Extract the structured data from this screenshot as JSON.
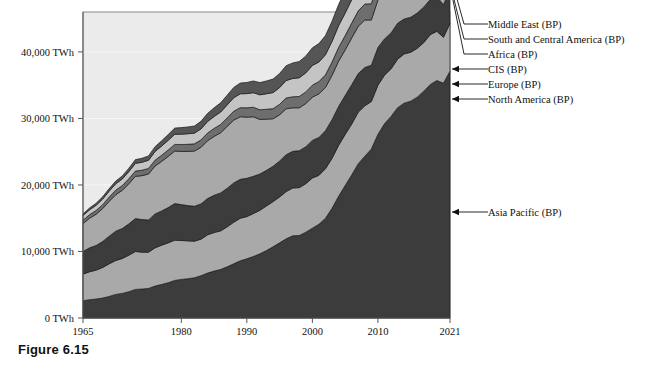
{
  "figure": {
    "caption": "Figure 6.15"
  },
  "chart_data": {
    "type": "area",
    "stacked": true,
    "title": "",
    "xlabel": "",
    "ylabel": "",
    "xlim": [
      1965,
      2021
    ],
    "ylim": [
      0,
      46000
    ],
    "grid": true,
    "legend_position": "right-callouts",
    "x_tick_labels": [
      "1965",
      "1980",
      "1990",
      "2000",
      "2010",
      "2021"
    ],
    "x_ticks": [
      1965,
      1980,
      1990,
      2000,
      2010,
      2021
    ],
    "y_tick_labels": [
      "0 TWh",
      "10,000 TWh",
      "20,000 TWh",
      "30,000 TWh",
      "40,000 TWh"
    ],
    "y_ticks": [
      0,
      10000,
      20000,
      30000,
      40000
    ],
    "unit": "TWh",
    "x": [
      1965,
      1966,
      1967,
      1968,
      1969,
      1970,
      1971,
      1972,
      1973,
      1974,
      1975,
      1976,
      1977,
      1978,
      1979,
      1980,
      1981,
      1982,
      1983,
      1984,
      1985,
      1986,
      1987,
      1988,
      1989,
      1990,
      1991,
      1992,
      1993,
      1994,
      1995,
      1996,
      1997,
      1998,
      1999,
      2000,
      2001,
      2002,
      2003,
      2004,
      2005,
      2006,
      2007,
      2008,
      2009,
      2010,
      2011,
      2012,
      2013,
      2014,
      2015,
      2016,
      2017,
      2018,
      2019,
      2020,
      2021
    ],
    "series": [
      {
        "name": "Asia Pacific (BP)",
        "color": "#3c3c3c",
        "values": [
          2600,
          2750,
          2850,
          3000,
          3250,
          3550,
          3700,
          3950,
          4300,
          4350,
          4450,
          4800,
          5050,
          5300,
          5650,
          5800,
          5900,
          6050,
          6350,
          6750,
          7050,
          7300,
          7700,
          8150,
          8600,
          8900,
          9250,
          9650,
          10150,
          10700,
          11300,
          11900,
          12350,
          12400,
          12900,
          13500,
          14100,
          15000,
          16500,
          18300,
          19900,
          21500,
          23200,
          24300,
          25400,
          27600,
          29200,
          30300,
          31600,
          32300,
          32600,
          33200,
          34100,
          35100,
          35700,
          35300,
          37100
        ]
      },
      {
        "name": "North America (BP)",
        "color": "#a9a9a9",
        "values": [
          4000,
          4200,
          4350,
          4600,
          4900,
          5100,
          5250,
          5500,
          5700,
          5550,
          5450,
          5750,
          5900,
          6000,
          6050,
          5850,
          5700,
          5500,
          5500,
          5750,
          5800,
          5800,
          6000,
          6250,
          6400,
          6350,
          6450,
          6550,
          6700,
          6800,
          6900,
          7100,
          7200,
          7200,
          7300,
          7550,
          7350,
          7450,
          7500,
          7650,
          7700,
          7650,
          7750,
          7600,
          7150,
          7400,
          7300,
          7150,
          7300,
          7400,
          7350,
          7350,
          7300,
          7500,
          7400,
          6900,
          7200
        ]
      },
      {
        "name": "Europe (BP)",
        "color": "#3c3c3c",
        "values": [
          3400,
          3600,
          3700,
          3900,
          4150,
          4400,
          4500,
          4700,
          4950,
          4900,
          4850,
          5100,
          5150,
          5300,
          5500,
          5400,
          5300,
          5250,
          5300,
          5450,
          5600,
          5700,
          5800,
          5900,
          5850,
          5750,
          5600,
          5450,
          5350,
          5300,
          5400,
          5550,
          5500,
          5550,
          5550,
          5650,
          5700,
          5700,
          5800,
          5850,
          5850,
          5900,
          5800,
          5750,
          5450,
          5650,
          5450,
          5400,
          5400,
          5250,
          5250,
          5300,
          5350,
          5300,
          5200,
          4900,
          5150
        ]
      },
      {
        "name": "CIS (BP)",
        "color": "#a9a9a9",
        "values": [
          4200,
          4450,
          4700,
          4950,
          5250,
          5500,
          5750,
          6050,
          6350,
          6600,
          6900,
          7200,
          7450,
          7700,
          7900,
          8000,
          8150,
          8300,
          8500,
          8700,
          8850,
          9050,
          9300,
          9450,
          9400,
          9200,
          8950,
          8200,
          7700,
          7150,
          6950,
          6900,
          6550,
          6450,
          6500,
          6500,
          6550,
          6500,
          6700,
          6800,
          6850,
          7050,
          7100,
          7150,
          6800,
          7150,
          7300,
          7350,
          7250,
          7250,
          7150,
          7200,
          7400,
          7600,
          7600,
          7350,
          7800
        ]
      },
      {
        "name": "Africa (BP)",
        "color": "#6e6e6e",
        "values": [
          500,
          530,
          560,
          590,
          630,
          670,
          700,
          740,
          790,
          810,
          840,
          880,
          920,
          960,
          1000,
          1030,
          1060,
          1080,
          1110,
          1150,
          1200,
          1240,
          1280,
          1330,
          1370,
          1400,
          1430,
          1450,
          1480,
          1520,
          1570,
          1620,
          1660,
          1700,
          1740,
          1800,
          1850,
          1900,
          1980,
          2070,
          2150,
          2230,
          2320,
          2400,
          2440,
          2550,
          2600,
          2680,
          2740,
          2800,
          2830,
          2870,
          2920,
          2980,
          3020,
          2950,
          3080
        ]
      },
      {
        "name": "South and Central America (BP)",
        "color": "#c4c4c4",
        "values": [
          700,
          740,
          790,
          840,
          900,
          960,
          1010,
          1080,
          1160,
          1200,
          1230,
          1310,
          1380,
          1450,
          1520,
          1560,
          1590,
          1610,
          1660,
          1730,
          1790,
          1870,
          1950,
          2030,
          2090,
          2130,
          2190,
          2250,
          2330,
          2420,
          2520,
          2630,
          2740,
          2820,
          2860,
          2960,
          2940,
          3030,
          3110,
          3280,
          3400,
          3530,
          3680,
          3800,
          3760,
          3960,
          4050,
          4150,
          4250,
          4300,
          4220,
          4180,
          4230,
          4320,
          4330,
          4100,
          4350
        ]
      },
      {
        "name": "Middle East (BP)",
        "color": "#555555",
        "values": [
          250,
          270,
          300,
          330,
          370,
          410,
          450,
          500,
          560,
          600,
          650,
          720,
          790,
          860,
          930,
          980,
          1020,
          1070,
          1140,
          1220,
          1300,
          1380,
          1460,
          1540,
          1610,
          1680,
          1760,
          1840,
          1930,
          2020,
          2120,
          2230,
          2340,
          2440,
          2530,
          2650,
          2760,
          2880,
          3020,
          3180,
          3340,
          3510,
          3700,
          3890,
          3990,
          4200,
          4350,
          4520,
          4650,
          4780,
          4870,
          4960,
          5060,
          5180,
          5260,
          5150,
          5400
        ]
      }
    ],
    "callouts": [
      {
        "label": "Middle East (BP)",
        "series": "Middle East (BP)"
      },
      {
        "label": "South and Central America (BP)",
        "series": "South and Central America (BP)"
      },
      {
        "label": "Africa (BP)",
        "series": "Africa (BP)"
      },
      {
        "label": "CIS (BP)",
        "series": "CIS (BP)"
      },
      {
        "label": "Europe (BP)",
        "series": "Europe (BP)"
      },
      {
        "label": "North America (BP)",
        "series": "North America (BP)"
      },
      {
        "label": "Asia Pacific (BP)",
        "series": "Asia Pacific (BP)"
      }
    ],
    "colors": {
      "plot_background": "#ebebeb",
      "page_background": "#ffffff",
      "axis": "#555555",
      "text": "#111111"
    }
  }
}
